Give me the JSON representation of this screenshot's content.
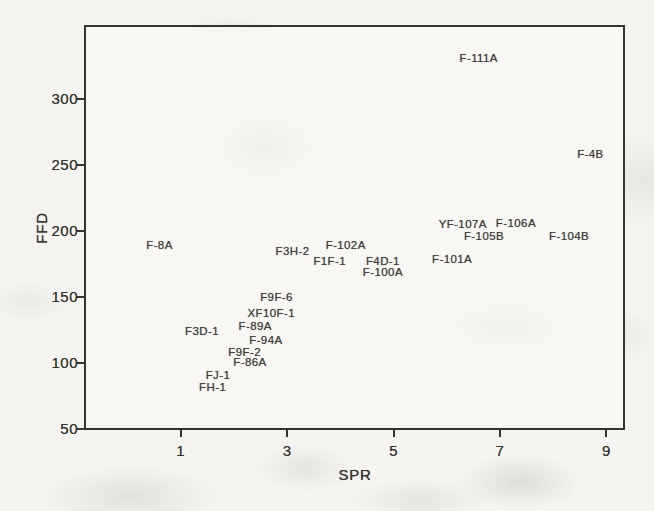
{
  "chart_data": {
    "type": "scatter",
    "title": "",
    "xlabel": "SPR",
    "ylabel": "FFD",
    "xlim": [
      -0.8,
      9.35
    ],
    "ylim": [
      50,
      355
    ],
    "x_ticks": [
      1,
      3,
      5,
      7,
      9
    ],
    "y_ticks": [
      50,
      100,
      150,
      200,
      250,
      300
    ],
    "grid": false,
    "legend": "none",
    "marker_style": "text-label-only",
    "points": [
      {
        "label": "FH-1",
        "x": 1.6,
        "y": 82
      },
      {
        "label": "FJ-1",
        "x": 1.7,
        "y": 91
      },
      {
        "label": "F-86A",
        "x": 2.3,
        "y": 101
      },
      {
        "label": "F9F-2",
        "x": 2.2,
        "y": 108
      },
      {
        "label": "F-94A",
        "x": 2.6,
        "y": 117
      },
      {
        "label": "F3D-1",
        "x": 1.4,
        "y": 124
      },
      {
        "label": "F-89A",
        "x": 2.4,
        "y": 128
      },
      {
        "label": "XF10F-1",
        "x": 2.7,
        "y": 138
      },
      {
        "label": "F9F-6",
        "x": 2.8,
        "y": 150
      },
      {
        "label": "F-100A",
        "x": 4.8,
        "y": 169
      },
      {
        "label": "F1F-1",
        "x": 3.8,
        "y": 177
      },
      {
        "label": "F4D-1",
        "x": 4.8,
        "y": 177
      },
      {
        "label": "F-101A",
        "x": 6.1,
        "y": 179
      },
      {
        "label": "F3H-2",
        "x": 3.1,
        "y": 185
      },
      {
        "label": "F-8A",
        "x": 0.6,
        "y": 189
      },
      {
        "label": "F-102A",
        "x": 4.1,
        "y": 189
      },
      {
        "label": "F-105B",
        "x": 6.7,
        "y": 196
      },
      {
        "label": "F-104B",
        "x": 8.3,
        "y": 196
      },
      {
        "label": "YF-107A",
        "x": 6.3,
        "y": 205
      },
      {
        "label": "F-106A",
        "x": 7.3,
        "y": 206
      },
      {
        "label": "F-4B",
        "x": 8.7,
        "y": 258
      },
      {
        "label": "F-111A",
        "x": 6.6,
        "y": 331
      }
    ],
    "colors": {
      "ink": "#343430",
      "label_ink": "#403e3a",
      "paper": "#f5f4f1",
      "plot_background": "#f8f7f4"
    }
  }
}
